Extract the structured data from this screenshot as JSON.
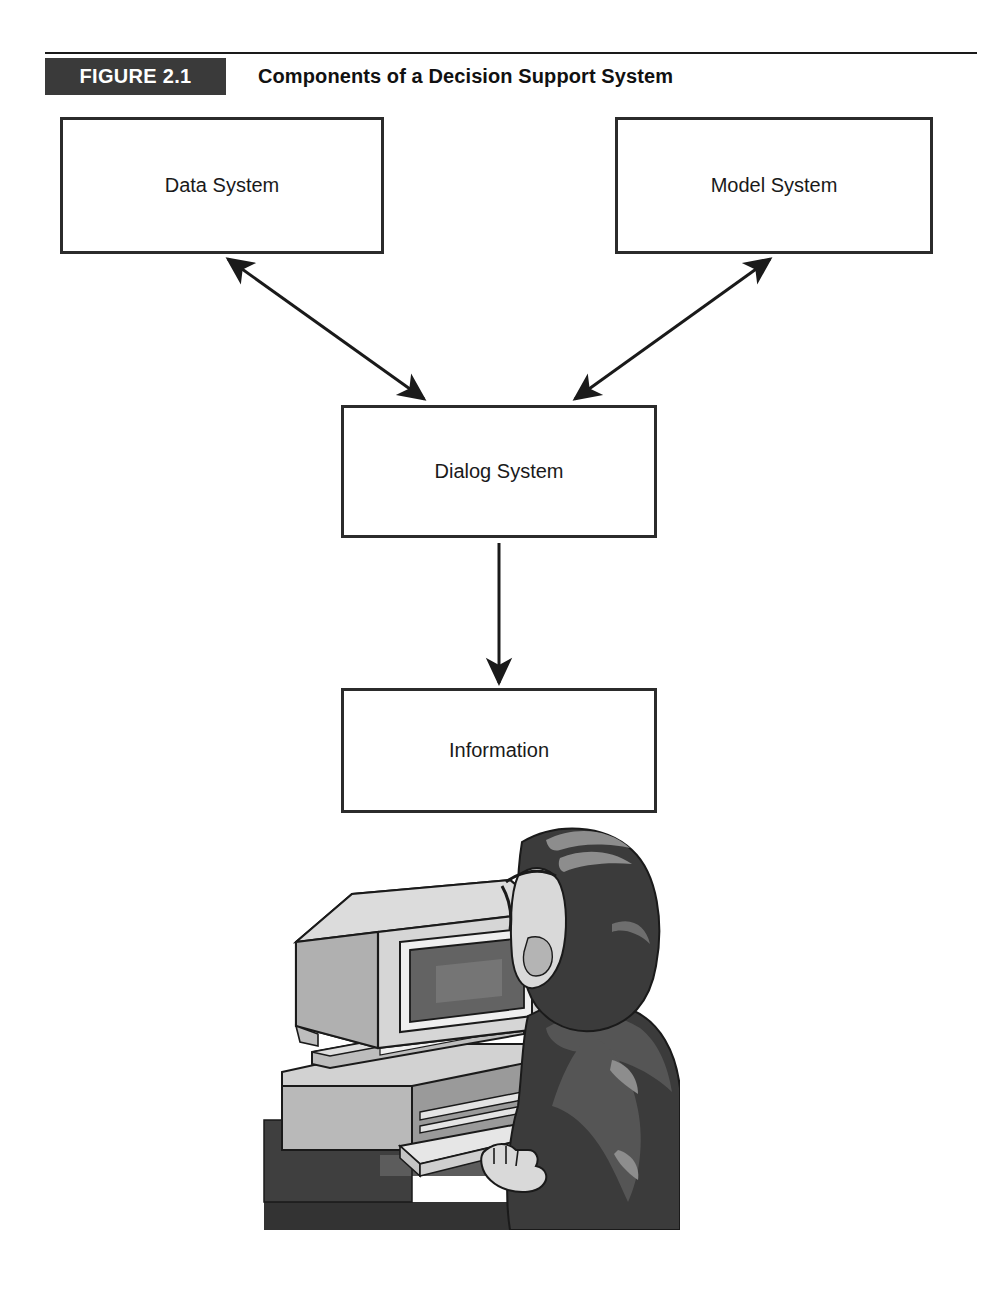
{
  "figure": {
    "tag_label": "FIGURE 2.1",
    "title": "Components of a Decision Support System",
    "tag_background": "#3a3a3a",
    "tag_text_color": "#ffffff",
    "rule_color": "#1a1a1a"
  },
  "diagram": {
    "type": "flowchart",
    "box_border_color": "#2b2b2b",
    "box_fill": "#ffffff",
    "arrow_color": "#1a1a1a",
    "nodes": [
      {
        "id": "data",
        "label": "Data System",
        "x": 60,
        "y": 117,
        "w": 324,
        "h": 137
      },
      {
        "id": "model",
        "label": "Model System",
        "x": 615,
        "y": 117,
        "w": 318,
        "h": 137
      },
      {
        "id": "dialog",
        "label": "Dialog System",
        "x": 341,
        "y": 405,
        "w": 316,
        "h": 133
      },
      {
        "id": "info",
        "label": "Information",
        "x": 341,
        "y": 688,
        "w": 316,
        "h": 125
      }
    ],
    "edges": [
      {
        "id": "edge-data-dialog",
        "from": "data",
        "to": "dialog",
        "direction": "bidirectional"
      },
      {
        "id": "edge-model-dialog",
        "from": "model",
        "to": "dialog",
        "direction": "bidirectional"
      },
      {
        "id": "edge-dialog-info",
        "from": "dialog",
        "to": "info",
        "direction": "forward"
      }
    ]
  },
  "illustration": {
    "caption": "person seated at a desktop computer terminal typing on a keyboard",
    "elements": [
      "crt-monitor",
      "computer-base-unit",
      "keyboard",
      "desk",
      "seated-person"
    ],
    "palette": {
      "outline": "#1a1a1a",
      "light_gray": "#c9c9c9",
      "mid_gray": "#9a9a9a",
      "dark_gray": "#6e6e6e",
      "screen": "#636363",
      "figure_dark": "#3b3b3b"
    }
  }
}
